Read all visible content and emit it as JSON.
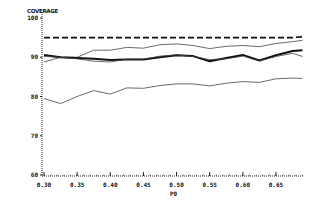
{
  "chart_data": {
    "type": "line",
    "title": "",
    "xlabel": "P0",
    "ylabel": "COVERAGE",
    "xlim": [
      0.3,
      0.69
    ],
    "ylim": [
      60,
      100
    ],
    "grid": false,
    "legend": null,
    "x_ticks": [
      "0.30",
      "0.35",
      "0.40",
      "0.45",
      "0.50",
      "0.55",
      "0.60",
      "0.65"
    ],
    "y_ticks": [
      "60",
      "70",
      "80",
      "90",
      "100"
    ],
    "x": [
      0.3,
      0.325,
      0.35,
      0.375,
      0.4,
      0.425,
      0.45,
      0.475,
      0.5,
      0.525,
      0.55,
      0.575,
      0.6,
      0.625,
      0.65,
      0.675,
      0.69
    ],
    "series": [
      {
        "name": "nominal (dashed)",
        "style": "dashed",
        "width": 1.6,
        "values": [
          95,
          95,
          95,
          95,
          95,
          95,
          95,
          95,
          95,
          95,
          95,
          95,
          95,
          95,
          95,
          95,
          95.2
        ]
      },
      {
        "name": "upper thin",
        "style": "solid",
        "width": 0.8,
        "values": [
          88.8,
          90.0,
          90.0,
          91.8,
          91.8,
          92.5,
          92.3,
          93.2,
          93.4,
          93.0,
          92.2,
          92.8,
          93.0,
          92.7,
          93.5,
          94.0,
          94.3
        ]
      },
      {
        "name": "bold",
        "style": "solid",
        "width": 2.0,
        "values": [
          90.6,
          90.0,
          89.8,
          89.6,
          89.3,
          89.4,
          89.4,
          90.0,
          90.5,
          90.3,
          89.0,
          89.8,
          90.6,
          89.2,
          90.5,
          91.6,
          91.8
        ]
      },
      {
        "name": "middle thin",
        "style": "solid",
        "width": 0.8,
        "values": [
          90.2,
          90.0,
          89.6,
          89.0,
          88.8,
          89.5,
          89.5,
          90.3,
          90.6,
          90.2,
          89.4,
          89.6,
          90.3,
          89.0,
          90.2,
          91.0,
          90.2
        ]
      },
      {
        "name": "lower thin",
        "style": "solid",
        "width": 0.8,
        "values": [
          79.5,
          78.2,
          80.0,
          81.5,
          80.6,
          82.2,
          82.1,
          82.8,
          83.2,
          83.2,
          82.7,
          83.4,
          83.8,
          83.6,
          84.5,
          84.7,
          84.6
        ]
      }
    ]
  },
  "labels": {
    "ylabel": "COVERAGE",
    "xlabel": "P0"
  }
}
